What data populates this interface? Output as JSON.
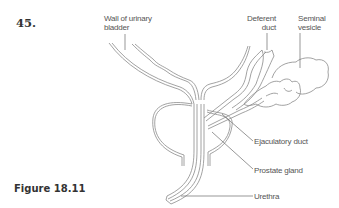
{
  "question_number": "45.",
  "figure_caption": "Figure 18.11",
  "labels": {
    "wall_of_bladder": "Wall of urinary bladder",
    "wall_of_bladder_line1": "Wall of urinary",
    "wall_of_bladder_line2": "bladder",
    "deferent_duct_line1": "Deferent",
    "deferent_duct_line2": "duct",
    "seminal_vesicle_line1": "Seminal",
    "seminal_vesicle_line2": "vesicle",
    "ejaculatory_duct": "Ejaculatory duct",
    "prostate_gland": "Prostate gland",
    "urethra": "Urethra"
  },
  "colors": {
    "line": "#8a8a8a",
    "text": "#555555",
    "heading": "#333333"
  }
}
